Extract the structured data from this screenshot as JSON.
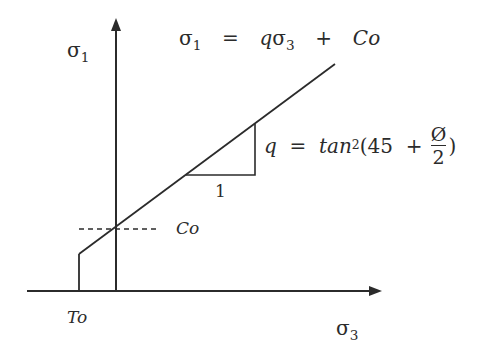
{
  "diagram": {
    "axes": {
      "y_label": "σ",
      "y_label_sub": "1",
      "x_label": "σ",
      "x_label_sub": "3"
    },
    "equation_main": {
      "lhs": "σ",
      "lhs_sub": "1",
      "eq": "=",
      "q": "q",
      "s3": "σ",
      "s3_sub": "3",
      "plus": "+",
      "co": "Co"
    },
    "equation_q": {
      "q": "q",
      "eq": "=",
      "func": "tan",
      "power": "2",
      "open": "(45",
      "plus": "+",
      "frac_num": "Ø",
      "frac_den": "2",
      "close": ")"
    },
    "labels": {
      "co": "Co",
      "to": "To",
      "slope_run": "1"
    },
    "colors": {
      "line": "#2b2b2b",
      "background": "#ffffff"
    }
  }
}
